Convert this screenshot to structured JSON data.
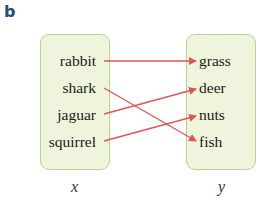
{
  "panel_label": "b",
  "domain_set": {
    "label": "x",
    "items": [
      "rabbit",
      "shark",
      "jaguar",
      "squirrel"
    ]
  },
  "codomain_set": {
    "label": "y",
    "items": [
      "grass",
      "deer",
      "nuts",
      "fish"
    ]
  },
  "mappings": [
    {
      "from": "rabbit",
      "to": "grass"
    },
    {
      "from": "shark",
      "to": "fish"
    },
    {
      "from": "jaguar",
      "to": "deer"
    },
    {
      "from": "squirrel",
      "to": "nuts"
    }
  ],
  "colors": {
    "box_fill": "#eef5dc",
    "box_border": "#b5d48e",
    "arrow": "#e05555",
    "panel_label": "#1f4e79"
  }
}
